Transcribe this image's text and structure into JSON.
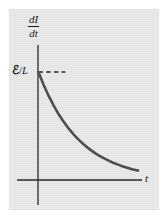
{
  "figure": {
    "title": "",
    "background_color": "#e9e9e9",
    "ink_color": "#1a1a1a",
    "curve_color": "#4a4a4a",
    "y_axis_label": {
      "numerator": "dI",
      "denominator": "dt"
    },
    "x_axis_label": "t",
    "value_marker": {
      "symbol_emf": "ℰ",
      "separator": "/",
      "symbol_inductance": "L",
      "full": "ℰ/L"
    }
  },
  "chart_data": {
    "type": "line",
    "title": "",
    "xlabel": "t",
    "ylabel": "dI/dt",
    "grid": false,
    "legend": null,
    "annotations": [
      {
        "text": "ℰ/L",
        "x": 0,
        "y": 1,
        "kind": "y-intercept-tick-label"
      },
      {
        "kind": "dashed-guide-line",
        "from": [
          0,
          1
        ],
        "to": [
          0.27,
          1
        ]
      }
    ],
    "xlim": [
      0,
      1
    ],
    "ylim": [
      0,
      1.25
    ],
    "series": [
      {
        "name": "dI/dt = (ℰ/L) e^(-t/τ)",
        "x": [
          0.0,
          0.05,
          0.1,
          0.15,
          0.2,
          0.25,
          0.3,
          0.35,
          0.4,
          0.45,
          0.5,
          0.55,
          0.6,
          0.65,
          0.7,
          0.75,
          0.8,
          0.85,
          0.9,
          0.95,
          1.0
        ],
        "y": [
          1.0,
          0.885,
          0.783,
          0.693,
          0.613,
          0.543,
          0.48,
          0.425,
          0.376,
          0.333,
          0.295,
          0.261,
          0.231,
          0.204,
          0.181,
          0.16,
          0.142,
          0.125,
          0.111,
          0.098,
          0.087
        ]
      }
    ]
  }
}
